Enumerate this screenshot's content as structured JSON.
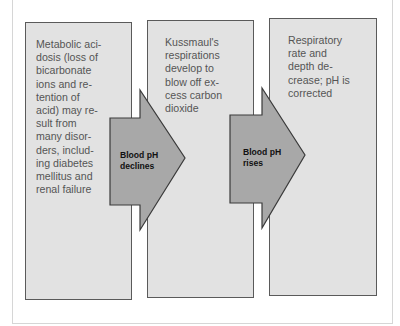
{
  "diagram": {
    "type": "flow",
    "steps": [
      {
        "text": "Metabolic aci-dosis (loss of bicarbonate ions and re-tention of acid) may re-sult from many disor-ders, includ-ing diabetes mellitus and renal failure",
        "lines": [
          "Metabolic aci-",
          "dosis (loss of",
          "bicarbonate",
          "ions and re-",
          "tention of",
          "acid) may re-",
          "sult from",
          "many disor-",
          "ders, includ-",
          "ing diabetes",
          "mellitus and",
          "renal failure"
        ]
      },
      {
        "text": "Kussmaul's respirations develop to blow off ex-cess carbon dioxide",
        "lines": [
          "Kussmaul's",
          "respirations",
          "develop to",
          "blow off ex-",
          "cess carbon",
          "dioxide"
        ]
      },
      {
        "text": "Respiratory rate and depth de-crease; pH is corrected",
        "lines": [
          "Respiratory",
          "rate and",
          "depth de-",
          "crease; pH is",
          "corrected"
        ]
      }
    ],
    "arrows": [
      {
        "lines": [
          "Blood pH",
          "declines"
        ],
        "from": 0,
        "to": 1
      },
      {
        "lines": [
          "Blood pH",
          "rises"
        ],
        "from": 1,
        "to": 2
      }
    ],
    "colors": {
      "box_fill": "#e2e2e2",
      "box_border": "#5a5a5a",
      "arrow_fill": "#a8a8a8",
      "arrow_border": "#3a3a3a",
      "box_text": "#555555",
      "arrow_text": "#111111"
    }
  }
}
